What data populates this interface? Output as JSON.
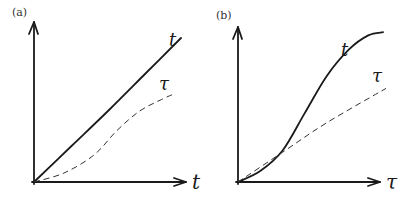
{
  "chart_data": [
    {
      "type": "line",
      "panel_label": "(a)",
      "xlabel": "t",
      "ylabel": "",
      "xlim": [
        0,
        1
      ],
      "ylim": [
        0,
        1
      ],
      "grid": false,
      "series": [
        {
          "name": "t",
          "style": "solid",
          "label": "t",
          "x": [
            0,
            0.25,
            0.5,
            0.75,
            0.98
          ],
          "y": [
            0,
            0.24,
            0.48,
            0.73,
            0.96
          ]
        },
        {
          "name": "τ",
          "style": "dashed",
          "label": "τ",
          "x": [
            0,
            0.2,
            0.4,
            0.55,
            0.7,
            0.85,
            0.94
          ],
          "y": [
            0,
            0.06,
            0.18,
            0.34,
            0.47,
            0.55,
            0.59
          ]
        }
      ]
    },
    {
      "type": "line",
      "panel_label": "(b)",
      "xlabel": "τ",
      "ylabel": "",
      "xlim": [
        0,
        1
      ],
      "ylim": [
        0,
        1
      ],
      "grid": false,
      "series": [
        {
          "name": "t",
          "style": "solid",
          "label": "t",
          "x": [
            0,
            0.15,
            0.3,
            0.45,
            0.6,
            0.75,
            0.88,
            0.98
          ],
          "y": [
            0,
            0.07,
            0.2,
            0.44,
            0.68,
            0.85,
            0.94,
            0.96
          ]
        },
        {
          "name": "τ",
          "style": "dashed",
          "label": "τ",
          "x": [
            0,
            0.3,
            0.6,
            1.0
          ],
          "y": [
            0,
            0.19,
            0.38,
            0.6
          ]
        }
      ]
    }
  ]
}
